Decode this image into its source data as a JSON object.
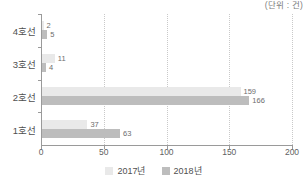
{
  "unit_note": "(단위 : 건)",
  "chart_data": {
    "type": "bar",
    "orientation": "horizontal",
    "title": "",
    "xlabel": "",
    "ylabel": "",
    "unit_note": "(단위 : 건)",
    "categories": [
      "4호선",
      "3호선",
      "2호선",
      "1호선"
    ],
    "series": [
      {
        "name": "2017년",
        "color": "#e9e9e9",
        "values": [
          2,
          11,
          159,
          37
        ]
      },
      {
        "name": "2018년",
        "color": "#bdbdbd",
        "values": [
          5,
          4,
          166,
          63
        ]
      }
    ],
    "xlim": [
      0,
      200
    ],
    "xticks": [
      0,
      50,
      100,
      150,
      200
    ],
    "xtick_labels": [
      "0",
      "50",
      "100",
      "150",
      "200"
    ],
    "grid": "vertical-dotted",
    "legend_position": "bottom-center",
    "data_labels": true
  },
  "legend": [
    {
      "label": "2017년",
      "color": "#e9e9e9"
    },
    {
      "label": "2018년",
      "color": "#bdbdbd"
    }
  ]
}
